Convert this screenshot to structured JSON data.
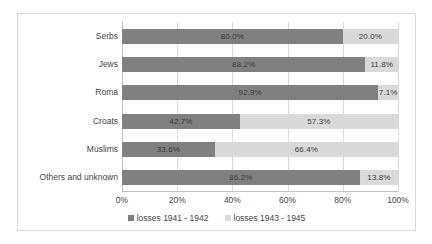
{
  "chart_data": {
    "type": "bar",
    "subtype": "stacked-horizontal-100-percent",
    "title": "",
    "xlabel": "",
    "ylabel": "",
    "xlim": [
      0,
      100
    ],
    "xticks": [
      "0%",
      "20%",
      "40%",
      "60%",
      "80%",
      "100%"
    ],
    "xtick_values": [
      0,
      20,
      40,
      60,
      80,
      100
    ],
    "grid": true,
    "legend_position": "bottom",
    "categories": [
      "Serbs",
      "Jews",
      "Roma",
      "Croats",
      "Muslims",
      "Others and unknown"
    ],
    "series": [
      {
        "name": "losses 1941 - 1942",
        "color": "#808080",
        "values": [
          80.0,
          88.2,
          92.9,
          42.7,
          33.6,
          86.2
        ],
        "labels": [
          "80.0%",
          "88.2%",
          "92.9%",
          "42.7%",
          "33.6%",
          "86.2%"
        ]
      },
      {
        "name": "losses 1943 - 1945",
        "color": "#d9d9d9",
        "values": [
          20.0,
          11.8,
          7.1,
          57.3,
          66.4,
          13.8
        ],
        "labels": [
          "20.0%",
          "11.8%",
          "7.1%",
          "57.3%",
          "66.4%",
          "13.8%"
        ]
      }
    ]
  },
  "legend": {
    "items": [
      {
        "label": "losses 1941 - 1942",
        "color": "#808080"
      },
      {
        "label": "losses 1943 - 1945",
        "color": "#d9d9d9"
      }
    ]
  },
  "colors": {
    "series_a": "#808080",
    "series_b": "#d9d9d9",
    "gridline": "#d9d9d9",
    "axis": "#bfbfbf",
    "frame_border": "#d8d8d8",
    "text": "#3f3f3f",
    "background": "#ffffff"
  }
}
